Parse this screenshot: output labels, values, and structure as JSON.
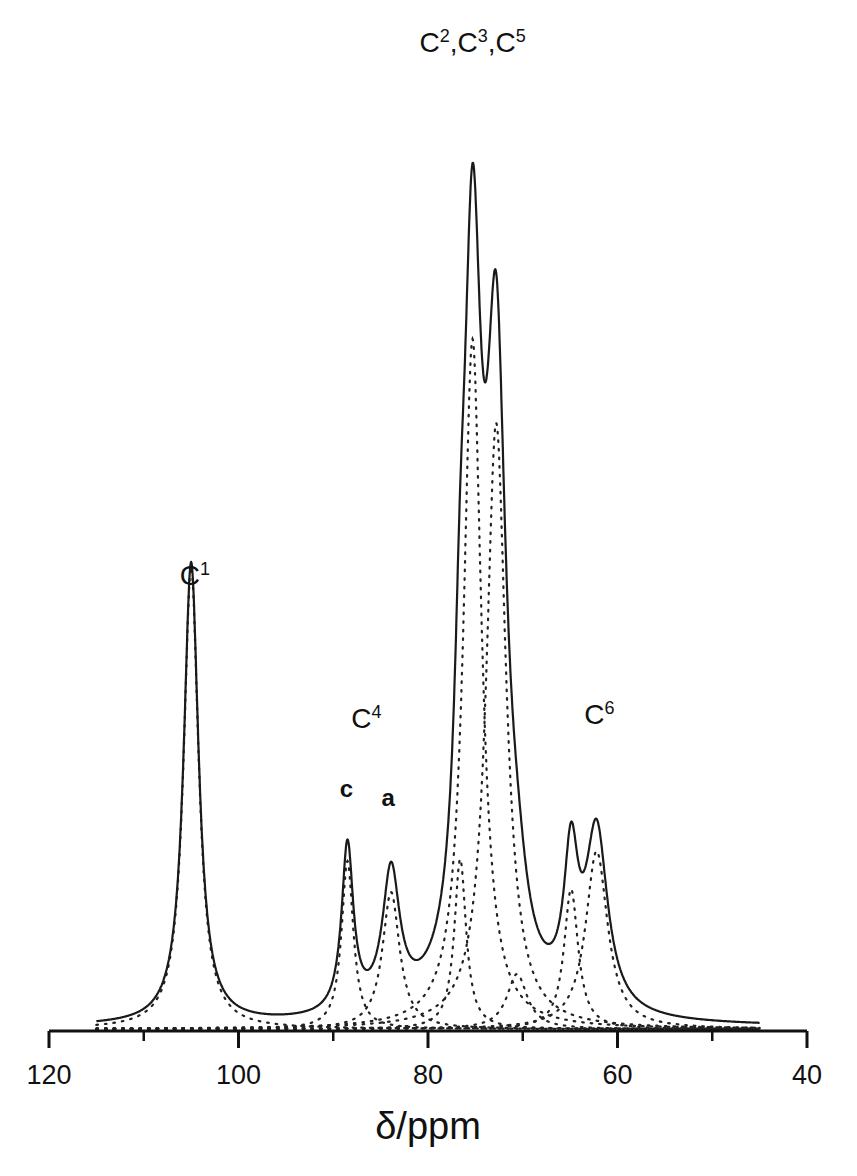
{
  "chart_data": {
    "type": "line",
    "title": "",
    "xlabel": "δ/ppm",
    "ylabel": "",
    "xlim": [
      120,
      40
    ],
    "x_reversed": true,
    "grid": false,
    "legend": null,
    "x_ticks": [
      120,
      100,
      80,
      60,
      40
    ],
    "x_tick_labels": [
      "120",
      "100",
      "80",
      "60",
      "40"
    ],
    "x_minor_ticks": [
      110,
      90,
      70,
      50
    ],
    "y_axis_visible": false,
    "spectrum_range": [
      115,
      45
    ],
    "series": [
      {
        "name": "experimental spectrum",
        "style": "solid",
        "peaks_observed": [
          {
            "ppm": 105.1,
            "intensity": 473
          },
          {
            "ppm": 88.5,
            "intensity": 219
          },
          {
            "ppm": 83.8,
            "intensity": 196
          },
          {
            "ppm": 75.3,
            "intensity": 936
          },
          {
            "ppm": 73.1,
            "intensity": 863
          },
          {
            "ppm": 64.9,
            "intensity": 271
          },
          {
            "ppm": 62.7,
            "intensity": 236
          }
        ]
      },
      {
        "name": "deconvoluted components",
        "style": "dotted",
        "components": [
          {
            "ppm": 105.0,
            "height": 462,
            "hwhm": 0.95
          },
          {
            "ppm": 88.5,
            "height": 168,
            "hwhm": 0.75
          },
          {
            "ppm": 83.9,
            "height": 137,
            "hwhm": 1.1
          },
          {
            "ppm": 76.6,
            "height": 170,
            "hwhm": 0.75
          },
          {
            "ppm": 75.3,
            "height": 690,
            "hwhm": 1.15
          },
          {
            "ppm": 72.8,
            "height": 606,
            "hwhm": 1.25
          },
          {
            "ppm": 70.6,
            "height": 55,
            "hwhm": 1.3
          },
          {
            "ppm": 64.9,
            "height": 140,
            "hwhm": 0.9
          },
          {
            "ppm": 62.2,
            "height": 178,
            "hwhm": 1.4
          }
        ]
      }
    ],
    "annotations": [
      {
        "text": "C",
        "sup": "1",
        "ppm": 104.6,
        "y_px": 585
      },
      {
        "text": "C",
        "sup": "4",
        "ppm": 86.5,
        "y_px": 728
      },
      {
        "text": "c",
        "ppm": 88.6,
        "y_px": 797
      },
      {
        "text": "a",
        "ppm": 84.2,
        "y_px": 806
      },
      {
        "text": "C²,C³,C⁵",
        "parts": [
          [
            "C",
            "2"
          ],
          [
            "C",
            "3"
          ],
          [
            "C",
            "5"
          ]
        ],
        "ppm": 75.3,
        "y_px": 52
      },
      {
        "text": "C",
        "sup": "6",
        "ppm": 61.9,
        "y_px": 724
      }
    ]
  },
  "axis": {
    "x_title": "δ/ppm"
  },
  "colors": {
    "line": "#1a1a1a",
    "dots": "#222222",
    "background": "#ffffff"
  }
}
